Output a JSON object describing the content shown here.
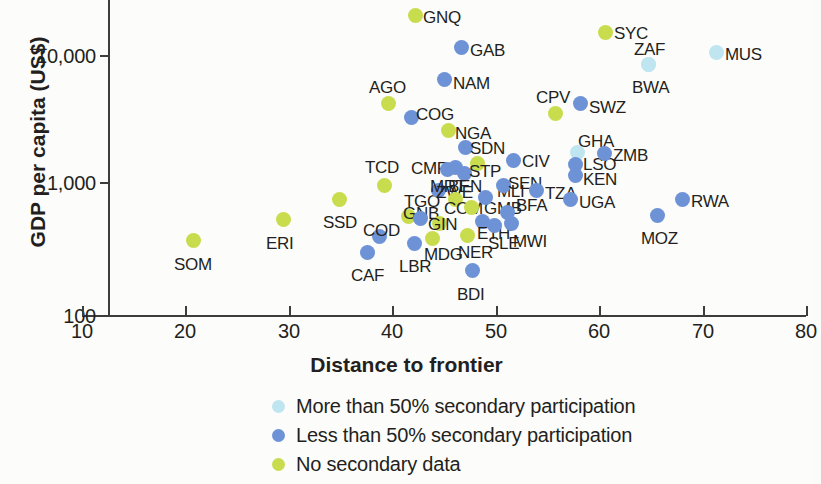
{
  "chart_data": {
    "type": "scatter",
    "title": "",
    "xlabel": "Distance to frontier",
    "ylabel": "GDP per capita (US$)",
    "xlim": [
      10,
      80
    ],
    "ylim": [
      100,
      20000
    ],
    "yscale": "log",
    "xticks": [
      "10",
      "20",
      "30",
      "40",
      "50",
      "60",
      "70",
      "80"
    ],
    "yticks": [
      "100",
      "1,000",
      "10,000"
    ],
    "grid": false,
    "legend_position": "below-center",
    "legend": [
      {
        "key": "more",
        "label": "More than 50% secondary participation",
        "color": "#bfe6f0"
      },
      {
        "key": "less",
        "label": "Less than 50% secondary participation",
        "color": "#6e92d6"
      },
      {
        "key": "none",
        "label": "No secondary data",
        "color": "#c9dc4e"
      }
    ],
    "points": [
      {
        "label": "SOM",
        "x": 19.4,
        "y": 360,
        "group": "none",
        "px": 186,
        "py": 233,
        "lx": 174,
        "ly": 255
      },
      {
        "label": "ERI",
        "x": 28.1,
        "y": 500,
        "group": "none",
        "px": 276,
        "py": 212,
        "lx": 266,
        "ly": 234
      },
      {
        "label": "SSD",
        "x": 33.5,
        "y": 780,
        "group": "none",
        "px": 332,
        "py": 192,
        "lx": 323,
        "ly": 213
      },
      {
        "label": "CAF",
        "x": 36.3,
        "y": 355,
        "group": "less",
        "px": 360,
        "py": 245,
        "lx": 351,
        "ly": 266
      },
      {
        "label": "COD",
        "x": 37.5,
        "y": 450,
        "group": "less",
        "px": 372,
        "py": 229,
        "lx": 363,
        "ly": 221
      },
      {
        "label": "TCD",
        "x": 38.0,
        "y": 1030,
        "group": "none",
        "px": 377,
        "py": 178,
        "lx": 365,
        "ly": 158
      },
      {
        "label": "AGO",
        "x": 38.3,
        "y": 4400,
        "group": "none",
        "px": 381,
        "py": 96,
        "lx": 369,
        "ly": 78
      },
      {
        "label": "GNB",
        "x": 40.3,
        "y": 640,
        "group": "none",
        "px": 401,
        "py": 209,
        "lx": 403,
        "ly": 204
      },
      {
        "label": "LBR",
        "x": 40.8,
        "y": 370,
        "group": "less",
        "px": 407,
        "py": 236,
        "lx": 399,
        "ly": 257
      },
      {
        "label": "TGO",
        "x": 41.4,
        "y": 620,
        "group": "less",
        "px": 413,
        "py": 211,
        "lx": 404,
        "ly": 192
      },
      {
        "label": "COG",
        "x": 41.6,
        "y": 3350,
        "group": "less",
        "px": 404,
        "py": 110,
        "lx": 416,
        "ly": 105
      },
      {
        "label": "GNQ",
        "x": 41.2,
        "y": 20000,
        "group": "none",
        "px": 408,
        "py": 8,
        "lx": 423,
        "ly": 8
      },
      {
        "label": "MDG",
        "x": 42.6,
        "y": 420,
        "group": "none",
        "px": 425,
        "py": 231,
        "lx": 424,
        "ly": 245
      },
      {
        "label": "ZWE",
        "x": 43.1,
        "y": 930,
        "group": "less",
        "px": 431,
        "py": 183,
        "lx": 436,
        "ly": 183
      },
      {
        "label": "GIN",
        "x": 43.2,
        "y": 540,
        "group": "none",
        "px": 432,
        "py": 216,
        "lx": 428,
        "ly": 215
      },
      {
        "label": "CMR",
        "x": 44.0,
        "y": 1380,
        "group": "less",
        "px": 448,
        "py": 160,
        "lx": 411,
        "ly": 159
      },
      {
        "label": "NAM",
        "x": 44.4,
        "y": 5300,
        "group": "less",
        "px": 437,
        "py": 72,
        "lx": 453,
        "ly": 74
      },
      {
        "label": "MRT",
        "x": 44.8,
        "y": 1350,
        "group": "less",
        "px": 440,
        "py": 162,
        "lx": 430,
        "ly": 177
      },
      {
        "label": "NGA",
        "x": 45.2,
        "y": 2650,
        "group": "none",
        "px": 441,
        "py": 123,
        "lx": 455,
        "ly": 124
      },
      {
        "label": "COM",
        "x": 45.6,
        "y": 800,
        "group": "none",
        "px": 448,
        "py": 192,
        "lx": 444,
        "ly": 199
      },
      {
        "label": "BEN",
        "x": 45.9,
        "y": 1200,
        "group": "less",
        "px": 457,
        "py": 166,
        "lx": 448,
        "ly": 177
      },
      {
        "label": "GAB",
        "x": 46.2,
        "y": 9200,
        "group": "less",
        "px": 454,
        "py": 40,
        "lx": 470,
        "ly": 41
      },
      {
        "label": "SDN",
        "x": 46.4,
        "y": 2000,
        "group": "less",
        "px": 458,
        "py": 140,
        "lx": 470,
        "ly": 139
      },
      {
        "label": "BDI",
        "x": 46.6,
        "y": 215,
        "group": "less",
        "px": 465,
        "py": 263,
        "lx": 457,
        "ly": 285
      },
      {
        "label": "GMB",
        "x": 46.8,
        "y": 700,
        "group": "none",
        "px": 464,
        "py": 200,
        "lx": 484,
        "ly": 199
      },
      {
        "label": "NER",
        "x": 47.0,
        "y": 400,
        "group": "none",
        "px": 460,
        "py": 228,
        "lx": 458,
        "ly": 243
      },
      {
        "label": "STP",
        "x": 47.2,
        "y": 1500,
        "group": "none",
        "px": 470,
        "py": 156,
        "lx": 469,
        "ly": 162
      },
      {
        "label": "ETH",
        "x": 47.5,
        "y": 560,
        "group": "less",
        "px": 475,
        "py": 214,
        "lx": 477,
        "ly": 224
      },
      {
        "label": "MLI",
        "x": 47.8,
        "y": 830,
        "group": "less",
        "px": 478,
        "py": 190,
        "lx": 497,
        "ly": 182
      },
      {
        "label": "SLE",
        "x": 48.4,
        "y": 520,
        "group": "less",
        "px": 487,
        "py": 218,
        "lx": 488,
        "ly": 234
      },
      {
        "label": "SEN",
        "x": 49.6,
        "y": 1030,
        "group": "less",
        "px": 496,
        "py": 178,
        "lx": 508,
        "ly": 174
      },
      {
        "label": "BFA",
        "x": 50.0,
        "y": 640,
        "group": "less",
        "px": 500,
        "py": 205,
        "lx": 516,
        "ly": 196
      },
      {
        "label": "MWI",
        "x": 50.5,
        "y": 510,
        "group": "less",
        "px": 504,
        "py": 216,
        "lx": 513,
        "ly": 232
      },
      {
        "label": "CIV",
        "x": 51.3,
        "y": 1580,
        "group": "less",
        "px": 506,
        "py": 153,
        "lx": 522,
        "ly": 152
      },
      {
        "label": "TZA",
        "x": 52.5,
        "y": 940,
        "group": "less",
        "px": 529,
        "py": 183,
        "lx": 545,
        "ly": 184
      },
      {
        "label": "CPV",
        "x": 54.8,
        "y": 3700,
        "group": "none",
        "px": 548,
        "py": 106,
        "lx": 536,
        "ly": 88
      },
      {
        "label": "SWZ",
        "x": 57.3,
        "y": 4500,
        "group": "less",
        "px": 573,
        "py": 96,
        "lx": 589,
        "ly": 98
      },
      {
        "label": "GHA",
        "x": 57.7,
        "y": 1830,
        "group": "more",
        "px": 570,
        "py": 145,
        "lx": 578,
        "ly": 132
      },
      {
        "label": "LSO",
        "x": 57.8,
        "y": 1480,
        "group": "less",
        "px": 568,
        "py": 157,
        "lx": 583,
        "ly": 155
      },
      {
        "label": "KEN",
        "x": 57.9,
        "y": 1280,
        "group": "less",
        "px": 568,
        "py": 168,
        "lx": 583,
        "ly": 170
      },
      {
        "label": "UGA",
        "x": 58.0,
        "y": 790,
        "group": "less",
        "px": 563,
        "py": 192,
        "lx": 579,
        "ly": 193
      },
      {
        "label": "ZMB",
        "x": 59.3,
        "y": 1700,
        "group": "less",
        "px": 597,
        "py": 146,
        "lx": 613,
        "ly": 146
      },
      {
        "label": "SYC",
        "x": 60.7,
        "y": 15000,
        "group": "none",
        "px": 598,
        "py": 25,
        "lx": 614,
        "ly": 24
      },
      {
        "label": "ZAF",
        "x": 61.9,
        "y": 8800,
        "group": "more",
        "px": 641,
        "py": 57,
        "lx": 634,
        "ly": 40
      },
      {
        "label": "BWA",
        "x": 62.0,
        "y": 7200,
        "group": "more",
        "px": 641,
        "py": 57,
        "lx": 632,
        "ly": 78
      },
      {
        "label": "MOZ",
        "x": 65.3,
        "y": 560,
        "group": "less",
        "px": 650,
        "py": 208,
        "lx": 641,
        "ly": 229
      },
      {
        "label": "RWA",
        "x": 68.3,
        "y": 760,
        "group": "less",
        "px": 675,
        "py": 192,
        "lx": 691,
        "ly": 192
      },
      {
        "label": "MUS",
        "x": 72.0,
        "y": 10200,
        "group": "more",
        "px": 709,
        "py": 45,
        "lx": 725,
        "ly": 45
      }
    ]
  },
  "axes": {
    "y_title": "GDP per capita (US$)",
    "x_title": "Distance to frontier",
    "y_labels": [
      {
        "text": "10,000",
        "top": 45
      },
      {
        "text": "1,000",
        "top": 172
      },
      {
        "text": "100",
        "top": 305
      }
    ],
    "x_labels": [
      {
        "text": "10",
        "left": 82
      },
      {
        "text": "20",
        "left": 185
      },
      {
        "text": "30",
        "left": 289
      },
      {
        "text": "40",
        "left": 392
      },
      {
        "text": "50",
        "left": 496
      },
      {
        "text": "60",
        "left": 599
      },
      {
        "text": "70",
        "left": 703
      },
      {
        "text": "80",
        "left": 806
      }
    ]
  }
}
